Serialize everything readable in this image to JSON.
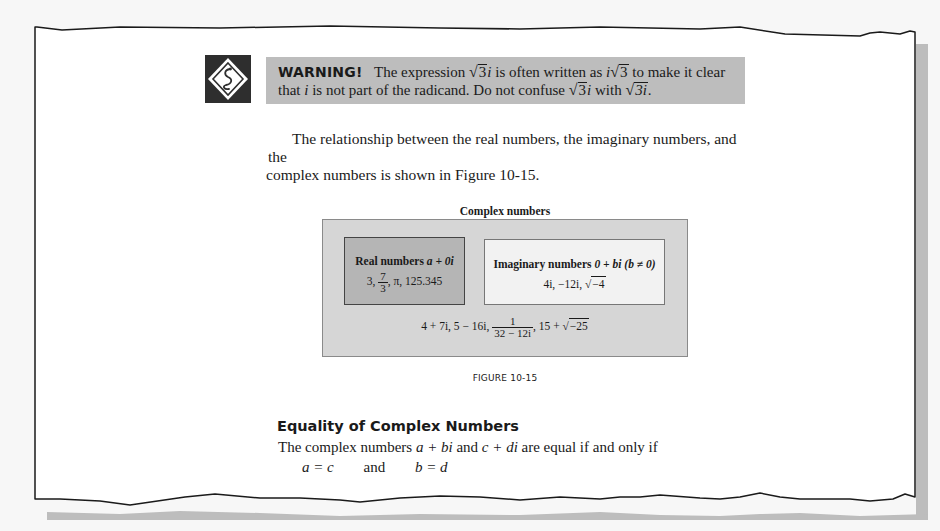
{
  "warning": {
    "icon": "snake-warning-icon",
    "title": "WARNING!",
    "text_1": "The expression",
    "expr_1_radicand": "3",
    "expr_1_suffix": "i",
    "text_2": "is often written as",
    "expr_2_prefix": "i",
    "expr_2_radicand": "3",
    "text_3": "to make it clear",
    "text_4": "that",
    "text_4_var": "i",
    "text_5": "is not part of the radicand. Do not confuse",
    "expr_3_radicand": "3",
    "expr_3_suffix": "i",
    "text_6": "with",
    "expr_4_radicand": "3i",
    "text_7": "."
  },
  "paragraph": {
    "line_1": "The relationship between the real numbers, the imaginary numbers, and the",
    "line_2": "complex numbers is shown in Figure 10-15."
  },
  "figure": {
    "title": "Complex numbers",
    "real": {
      "heading": "Real numbers",
      "form": "a + 0i",
      "ex_1": "3,",
      "frac_num": "7",
      "frac_den": "3",
      "ex_rest": ", π, 125.345"
    },
    "imaginary": {
      "heading": "Imaginary numbers",
      "form": "0 + bi",
      "condition": "(b ≠ 0)",
      "examples": "4i, −12i,",
      "radicand": "−4"
    },
    "complex": {
      "examples": "4 + 7i,  5 − 16i,",
      "frac_num": "1",
      "frac_den": "32 − 12i",
      "ex_rest": ", 15 +",
      "radicand": "−25"
    },
    "caption": "FIGURE 10-15"
  },
  "section": {
    "heading": "Equality of Complex Numbers",
    "body_prefix": "The complex numbers",
    "expr_1": "a + bi",
    "body_mid": "and",
    "expr_2": "c + di",
    "body_suffix": "are equal if and only if",
    "eq_1": "a = c",
    "eq_and": "and",
    "eq_2": "b = d"
  }
}
